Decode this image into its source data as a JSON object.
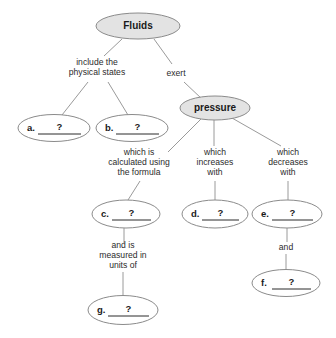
{
  "diagram": {
    "type": "concept-map",
    "title_node": "Fluids",
    "nodes": [
      {
        "id": "fluids",
        "label": "Fluids",
        "style": "shaded",
        "cx": 138,
        "cy": 26,
        "rx": 42,
        "ry": 13
      },
      {
        "id": "pressure",
        "label": "pressure",
        "style": "shaded",
        "cx": 215,
        "cy": 108,
        "rx": 35,
        "ry": 12
      },
      {
        "id": "a",
        "letter": "a.",
        "blank": "?",
        "style": "plain",
        "cx": 54,
        "cy": 128,
        "rx": 36,
        "ry": 13.5
      },
      {
        "id": "b",
        "letter": "b.",
        "blank": "?",
        "style": "plain",
        "cx": 132,
        "cy": 128,
        "rx": 36,
        "ry": 13.5
      },
      {
        "id": "c",
        "letter": "c.",
        "blank": "?",
        "style": "plain",
        "cx": 126,
        "cy": 214,
        "rx": 34,
        "ry": 14
      },
      {
        "id": "d",
        "letter": "d.",
        "blank": "?",
        "style": "plain",
        "cx": 215,
        "cy": 214,
        "rx": 33,
        "ry": 14
      },
      {
        "id": "e",
        "letter": "e.",
        "blank": "?",
        "style": "plain",
        "cx": 287,
        "cy": 214,
        "rx": 35,
        "ry": 14
      },
      {
        "id": "f",
        "letter": "f.",
        "blank": "?",
        "style": "plain",
        "cx": 286,
        "cy": 283,
        "rx": 34,
        "ry": 13.5
      },
      {
        "id": "g",
        "letter": "g.",
        "blank": "?",
        "style": "plain",
        "cx": 123,
        "cy": 310,
        "rx": 35,
        "ry": 14.5
      }
    ],
    "connector_labels": [
      {
        "id": "include-the-physical-states",
        "lines": [
          "include the",
          "physical states"
        ],
        "x": 97,
        "y": 68
      },
      {
        "id": "exert",
        "lines": [
          "exert"
        ],
        "x": 176,
        "y": 74
      },
      {
        "id": "which-is-calculated",
        "lines": [
          "which is",
          "calculated using",
          "the formula"
        ],
        "x": 139,
        "y": 163
      },
      {
        "id": "which-increases-with",
        "lines": [
          "which",
          "increases",
          "with"
        ],
        "x": 215,
        "y": 163
      },
      {
        "id": "which-decreases-with",
        "lines": [
          "which",
          "decreases",
          "with"
        ],
        "x": 288,
        "y": 163
      },
      {
        "id": "and-is-measured-in-units-of",
        "lines": [
          "and is",
          "measured in",
          "units of"
        ],
        "x": 123,
        "y": 256
      },
      {
        "id": "and",
        "lines": [
          "and"
        ],
        "x": 286,
        "y": 248
      }
    ],
    "edges": [
      {
        "id": "fluids-to-states-label",
        "from": "fluids",
        "to": "include-the-physical-states",
        "x1": 122,
        "y1": 39,
        "x2": 104,
        "y2": 56
      },
      {
        "id": "fluids-to-exert-label",
        "from": "fluids",
        "to": "exert",
        "x1": 154,
        "y1": 39,
        "x2": 172,
        "y2": 64
      },
      {
        "id": "states-to-a",
        "from": "include-the-physical-states",
        "to": "a",
        "x1": 88,
        "y1": 82,
        "x2": 62,
        "y2": 115
      },
      {
        "id": "states-to-b",
        "from": "include-the-physical-states",
        "to": "b",
        "x1": 108,
        "y1": 82,
        "x2": 128,
        "y2": 115
      },
      {
        "id": "exert-to-pressure",
        "from": "exert",
        "to": "pressure",
        "x1": 184,
        "y1": 82,
        "x2": 202,
        "y2": 99
      },
      {
        "id": "pressure-to-formula",
        "from": "pressure",
        "to": "which-is-calculated",
        "x1": 201,
        "y1": 119,
        "x2": 168,
        "y2": 152
      },
      {
        "id": "pressure-to-increases",
        "from": "pressure",
        "to": "which-increases-with",
        "x1": 214,
        "y1": 120,
        "x2": 214,
        "y2": 146
      },
      {
        "id": "pressure-to-decreases",
        "from": "pressure",
        "to": "which-decreases-with",
        "x1": 232,
        "y1": 118,
        "x2": 281,
        "y2": 146
      },
      {
        "id": "formula-to-c",
        "from": "which-is-calculated",
        "to": "c",
        "x1": 140,
        "y1": 181,
        "x2": 128,
        "y2": 200
      },
      {
        "id": "increases-to-d",
        "from": "which-increases-with",
        "to": "d",
        "x1": 215,
        "y1": 181,
        "x2": 215,
        "y2": 200
      },
      {
        "id": "decreases-to-e",
        "from": "which-decreases-with",
        "to": "e",
        "x1": 288,
        "y1": 181,
        "x2": 288,
        "y2": 200
      },
      {
        "id": "c-to-units-label",
        "from": "c",
        "to": "and-is-measured-in-units-of",
        "x1": 124,
        "y1": 228,
        "x2": 124,
        "y2": 243
      },
      {
        "id": "units-to-g",
        "from": "and-is-measured-in-units-of",
        "to": "g",
        "x1": 123,
        "y1": 272,
        "x2": 123,
        "y2": 296
      },
      {
        "id": "e-to-and-label",
        "from": "e",
        "to": "and",
        "x1": 287,
        "y1": 228,
        "x2": 287,
        "y2": 242
      },
      {
        "id": "and-to-f",
        "from": "and",
        "to": "f",
        "x1": 286,
        "y1": 254,
        "x2": 286,
        "y2": 270
      }
    ]
  },
  "colors": {
    "shaded_node_fill": "#e3e3e3",
    "plain_node_fill": "#ffffff",
    "node_stroke": "#8b8b8b",
    "edge_stroke": "#9a9a9a",
    "text": "#1a1a1a",
    "background": "#ffffff"
  }
}
